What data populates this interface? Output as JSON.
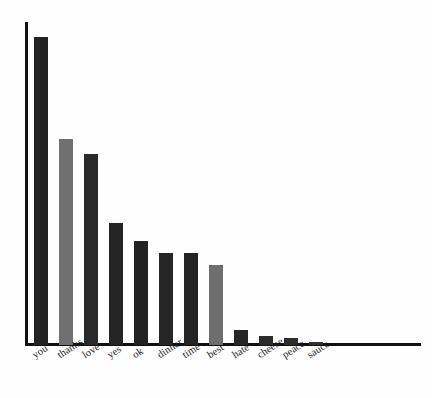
{
  "chart_data": {
    "type": "bar",
    "title": "",
    "subtitle": "",
    "xlabel": "",
    "ylabel": "",
    "categories": [
      "you",
      "thanks",
      "love",
      "yes",
      "ok",
      "dinner",
      "time",
      "best",
      "hate",
      "cheese",
      "peace",
      "sauce"
    ],
    "values": [
      308,
      206,
      191,
      122,
      104,
      92,
      92,
      80,
      15,
      9,
      7,
      3
    ],
    "ylim": [
      0,
      323
    ],
    "grid": false,
    "legend": null,
    "bar_colors": [
      "#222222",
      "#707070",
      "#2a2a2a",
      "#242424",
      "#222222",
      "#262626",
      "#242424",
      "#6e6e6e",
      "#262626",
      "#2a2a2a",
      "#2c2c2c",
      "#303030"
    ],
    "axis_color": "#111111",
    "background_color": "#fefefe",
    "bar_width": 14,
    "bar_pitch": 25,
    "first_bar_x": 34,
    "baseline_y": 345,
    "axis_top_y": 22,
    "axis_right_x": 421
  }
}
